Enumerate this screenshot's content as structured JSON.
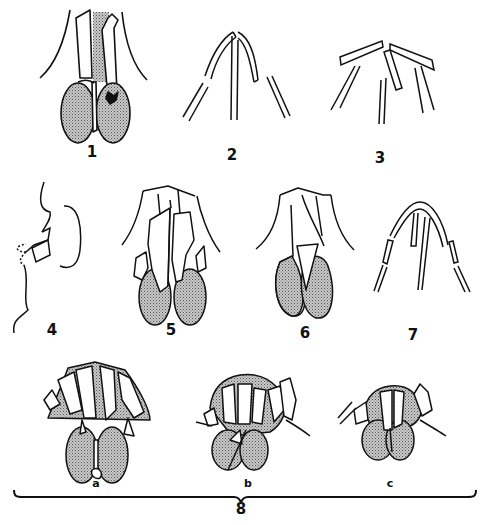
{
  "figure": {
    "panels": [
      {
        "id": "1",
        "label": "1",
        "x": 92,
        "y": 145
      },
      {
        "id": "2",
        "label": "2",
        "x": 232,
        "y": 148
      },
      {
        "id": "3",
        "label": "3",
        "x": 380,
        "y": 151
      },
      {
        "id": "4",
        "label": "4",
        "x": 52,
        "y": 323
      },
      {
        "id": "5",
        "label": "5",
        "x": 171,
        "y": 323
      },
      {
        "id": "6",
        "label": "6",
        "x": 305,
        "y": 326
      },
      {
        "id": "7",
        "label": "7",
        "x": 413,
        "y": 328
      }
    ],
    "group8": {
      "label": "8",
      "subpanels": [
        {
          "id": "a",
          "label": "a"
        },
        {
          "id": "b",
          "label": "b"
        },
        {
          "id": "c",
          "label": "c"
        }
      ]
    },
    "colors": {
      "line": "#111111",
      "stipple": "#9a9a9a",
      "background": "#ffffff"
    }
  }
}
